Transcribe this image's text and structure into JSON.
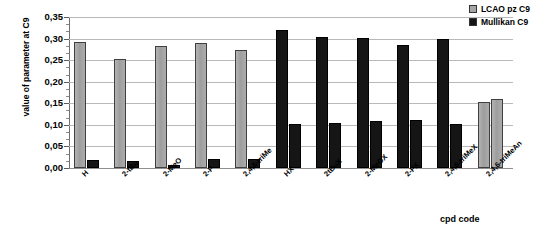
{
  "chart_data": {
    "type": "bar",
    "title": "",
    "xlabel": "cpd code",
    "ylabel": "value of parameter at C9",
    "ylim": [
      0.0,
      0.35
    ],
    "ytick_step": 0.05,
    "ytick_labels": [
      "0,00",
      "0,05",
      "0,10",
      "0,15",
      "0,20",
      "0,25",
      "0,30",
      "0,35"
    ],
    "ytick_values": [
      0.0,
      0.05,
      0.1,
      0.15,
      0.2,
      0.25,
      0.3,
      0.35
    ],
    "grid": true,
    "legend_position": "top-right",
    "categories": [
      "H",
      "2-tBu",
      "2-MeO",
      "2-F",
      "2,4,6-triMe",
      "HX",
      "2tBuX",
      "2-MeOX",
      "2-FX",
      "2,4,6-triMeX",
      "2,4,6-triMeAn"
    ],
    "series": [
      {
        "name": "LCAO pz C9",
        "color": "#a6a6a6",
        "values": [
          0.291,
          0.253,
          0.282,
          0.29,
          0.274,
          0.32,
          0.303,
          0.301,
          0.284,
          0.3,
          0.152
        ]
      },
      {
        "name": "Mullikan C9",
        "color": "#151515",
        "values": [
          0.019,
          0.017,
          0.008,
          0.021,
          0.021,
          0.103,
          0.105,
          0.11,
          0.112,
          0.102,
          0.161
        ]
      }
    ],
    "series_colors_by_group": {
      "note": "groups 6-10 render both series dark; group 11 renders both series light",
      "dark_groups": [
        5,
        6,
        7,
        8,
        9
      ],
      "light_groups": [
        0,
        1,
        2,
        3,
        4,
        10
      ]
    }
  },
  "legend": {
    "items": [
      {
        "label": "LCAO pz C9",
        "swatch": "light"
      },
      {
        "label": "Mullikan C9",
        "swatch": "dark"
      }
    ]
  },
  "axes": {
    "x_title": "cpd code",
    "y_title": "value of parameter at C9"
  }
}
